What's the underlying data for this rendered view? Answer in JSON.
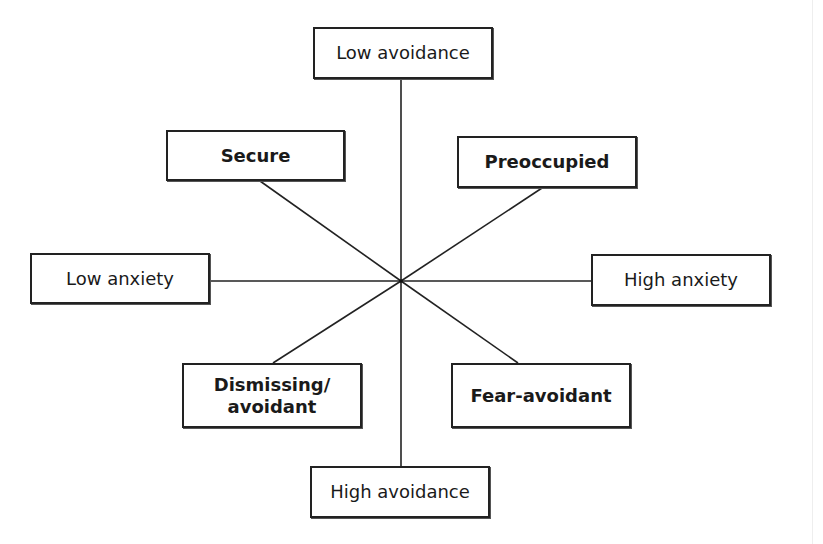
{
  "diagram": {
    "type": "attachment-style-two-dimensional-model",
    "center": {
      "x": 401,
      "y": 281
    },
    "colors": {
      "stroke": "#222222",
      "background": "#ffffff",
      "text": "#1a1a1a"
    },
    "axes": {
      "vertical": {
        "top": {
          "label": "Low avoidance"
        },
        "bottom": {
          "label": "High avoidance"
        }
      },
      "horizontal": {
        "left": {
          "label": "Low anxiety"
        },
        "right": {
          "label": "High anxiety"
        }
      }
    },
    "styles": {
      "top_left": {
        "label": "Secure"
      },
      "top_right": {
        "label": "Preoccupied"
      },
      "bottom_left": {
        "label_line1": "Dismissing/",
        "label_line2": "avoidant"
      },
      "bottom_right": {
        "label": "Fear-avoidant"
      }
    }
  }
}
